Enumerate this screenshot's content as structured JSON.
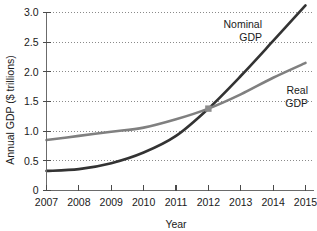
{
  "chart_data": {
    "type": "line",
    "title": "",
    "xlabel": "Year",
    "ylabel": "Annual GDP ($ trillions)",
    "x": [
      2007,
      2008,
      2009,
      2010,
      2011,
      2012,
      2013,
      2014,
      2015
    ],
    "xtick_labels": [
      "2007",
      "2008",
      "2009",
      "2010",
      "2011",
      "2012",
      "2013",
      "2014",
      "2015"
    ],
    "ytick_labels": [
      "0",
      "0.5",
      "1.0",
      "1.5",
      "2.0",
      "2.5",
      "3.0"
    ],
    "ytick_values": [
      0,
      0.5,
      1.0,
      1.5,
      2.0,
      2.5,
      3.0
    ],
    "xlim": [
      2006.8,
      2015.2
    ],
    "ylim": [
      0,
      3.2
    ],
    "grid": "horizontal-dotted",
    "legend": "inline-labels",
    "series": [
      {
        "name": "Nominal GDP",
        "label": "Nominal\nGDP",
        "label_line1": "Nominal",
        "label_line2": "GDP",
        "color": "#333333",
        "values": [
          0.33,
          0.36,
          0.46,
          0.64,
          0.92,
          1.38,
          1.93,
          2.52,
          3.12
        ]
      },
      {
        "name": "Real GDP",
        "label": "Real\nGDP",
        "label_line1": "Real",
        "label_line2": "GDP",
        "color": "#808080",
        "values": [
          0.85,
          0.92,
          0.99,
          1.06,
          1.2,
          1.38,
          1.62,
          1.9,
          2.15
        ]
      }
    ],
    "intersection": {
      "x": 2012,
      "y": 1.38,
      "marker": "square",
      "color": "#8c8c8c"
    }
  }
}
